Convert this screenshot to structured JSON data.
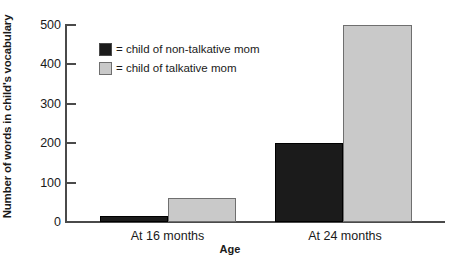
{
  "chart_data": {
    "type": "bar",
    "title": "",
    "subtitle": "",
    "xlabel": "Age",
    "ylabel": "Number of words in child's vocabulary",
    "categories": [
      "At 16 months",
      "At 24 months"
    ],
    "series": [
      {
        "name": "= child of non-talkative mom",
        "color": "#1b1b1b",
        "values": [
          15,
          200
        ]
      },
      {
        "name": "= child of talkative mom",
        "color": "#c9c9c9",
        "values": [
          60,
          500
        ]
      }
    ],
    "ylim": [
      0,
      500
    ],
    "yticks": [
      0,
      100,
      200,
      300,
      400,
      500
    ],
    "ytick_labels": [
      "0",
      "100",
      "200",
      "300",
      "400",
      "500"
    ],
    "grid": false,
    "legend_position": "upper-left-inside"
  },
  "axes": {
    "y_title": "Number of words in child's vocabulary",
    "x_title": "Age",
    "y_ticks": [
      "500",
      "400",
      "300",
      "200",
      "100",
      "0"
    ]
  },
  "legend": {
    "items": [
      {
        "label": "= child of non-talkative mom",
        "swatch": "dark-square-swatch"
      },
      {
        "label": "= child of talkative mom",
        "swatch": "light-square-swatch"
      }
    ]
  },
  "x_categories": [
    {
      "label": "At 16 months"
    },
    {
      "label": "At 24 months"
    }
  ],
  "colors": {
    "non_talkative": "#1b1b1b",
    "talkative": "#c9c9c9",
    "axis": "#4a4a4a",
    "background": "#ffffff"
  }
}
